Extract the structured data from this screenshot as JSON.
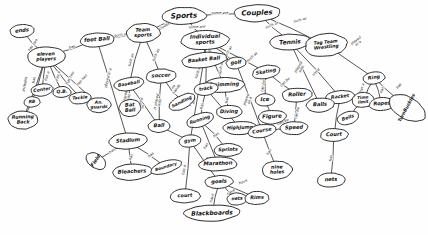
{
  "diagram": {
    "style": "hand-drawn ellipse concept map, black ink on white paper",
    "ink_color": "#1e1e1e",
    "paper_color": "#fefefe",
    "width": 428,
    "height": 235
  },
  "nodes": [
    {
      "id": "sports",
      "label": "Sports",
      "x": 184,
      "y": 16,
      "rx": 22,
      "ry": 8.5,
      "fs": 7.2,
      "rot": -2
    },
    {
      "id": "couples",
      "label": "Couples",
      "x": 257,
      "y": 13,
      "rx": 23,
      "ry": 8.5,
      "fs": 7.0,
      "rot": -2
    },
    {
      "id": "individual",
      "label": "Individual\nsports",
      "x": 205,
      "y": 40,
      "rx": 24,
      "ry": 9.5,
      "fs": 5.4,
      "rot": -2
    },
    {
      "id": "teamsports",
      "label": "Team\nsports",
      "x": 143,
      "y": 33,
      "rx": 17,
      "ry": 9.5,
      "fs": 5.0,
      "rot": -3
    },
    {
      "id": "football",
      "label": "foot Ball",
      "x": 97,
      "y": 40,
      "rx": 17,
      "ry": 7.0,
      "fs": 5.4,
      "rot": -4
    },
    {
      "id": "elevenplayers",
      "label": "eleven\nplayers",
      "x": 46,
      "y": 57,
      "rx": 19,
      "ry": 10.0,
      "fs": 4.8,
      "rot": -2
    },
    {
      "id": "ends",
      "label": "ends",
      "x": 22,
      "y": 31,
      "rx": 12,
      "ry": 6.5,
      "fs": 5.2,
      "rot": -6
    },
    {
      "id": "center",
      "label": "Center",
      "x": 42,
      "y": 90,
      "rx": 11,
      "ry": 6.0,
      "fs": 4.6,
      "rot": -8
    },
    {
      "id": "qb",
      "label": "Q.B.",
      "x": 62,
      "y": 92,
      "rx": 9,
      "ry": 5.5,
      "fs": 4.6,
      "rot": -3
    },
    {
      "id": "tackle",
      "label": "Tackle",
      "x": 80,
      "y": 98,
      "rx": 11,
      "ry": 5.8,
      "fs": 4.4,
      "rot": -5
    },
    {
      "id": "rb",
      "label": "RB",
      "x": 32,
      "y": 102,
      "rx": 8,
      "ry": 5.2,
      "fs": 4.4,
      "rot": -3
    },
    {
      "id": "anguards",
      "label": "An.\nguards",
      "x": 99,
      "y": 105,
      "rx": 12,
      "ry": 7.5,
      "fs": 4.4,
      "rot": -2
    },
    {
      "id": "runningback",
      "label": "Running\nBack",
      "x": 23,
      "y": 120,
      "rx": 15,
      "ry": 9.0,
      "fs": 4.8,
      "rot": -2
    },
    {
      "id": "baseball",
      "label": "Baseball",
      "x": 129,
      "y": 84,
      "rx": 15,
      "ry": 6.5,
      "fs": 4.6,
      "rot": -10
    },
    {
      "id": "soccer",
      "label": "soccer",
      "x": 161,
      "y": 76,
      "rx": 15,
      "ry": 7.0,
      "fs": 5.2,
      "rot": -3
    },
    {
      "id": "batball",
      "label": "Bat\nBall",
      "x": 130,
      "y": 108,
      "rx": 11,
      "ry": 8.5,
      "fs": 5.0,
      "rot": -3
    },
    {
      "id": "handling",
      "label": "handling",
      "x": 182,
      "y": 102,
      "rx": 14,
      "ry": 6.5,
      "fs": 4.4,
      "rot": -26
    },
    {
      "id": "ball",
      "label": "Ball",
      "x": 159,
      "y": 126,
      "rx": 11,
      "ry": 6.5,
      "fs": 5.2,
      "rot": -2
    },
    {
      "id": "basketball",
      "label": "Basket Ball",
      "x": 204,
      "y": 60,
      "rx": 23,
      "ry": 7.5,
      "fs": 5.2,
      "rot": -6
    },
    {
      "id": "golf",
      "label": "golf",
      "x": 236,
      "y": 63,
      "rx": 10,
      "ry": 5.8,
      "fs": 5.0,
      "rot": -6
    },
    {
      "id": "swimming",
      "label": "Swimming",
      "x": 224,
      "y": 85,
      "rx": 20,
      "ry": 7.5,
      "fs": 5.2,
      "rot": -2
    },
    {
      "id": "diving",
      "label": "Diving",
      "x": 229,
      "y": 112,
      "rx": 13,
      "ry": 6.5,
      "fs": 5.0,
      "rot": -2
    },
    {
      "id": "track",
      "label": "track",
      "x": 206,
      "y": 89,
      "rx": 12,
      "ry": 6.2,
      "fs": 4.8,
      "rot": -8
    },
    {
      "id": "highjump",
      "label": "HighJump",
      "x": 240,
      "y": 128,
      "rx": 17,
      "ry": 6.5,
      "fs": 4.8,
      "rot": -2
    },
    {
      "id": "running",
      "label": "Running",
      "x": 200,
      "y": 120,
      "rx": 14,
      "ry": 6.5,
      "fs": 4.6,
      "rot": -18
    },
    {
      "id": "sprints",
      "label": "Sprints",
      "x": 228,
      "y": 150,
      "rx": 14,
      "ry": 6.5,
      "fs": 4.8,
      "rot": -2
    },
    {
      "id": "marathon",
      "label": "Marathon",
      "x": 218,
      "y": 164,
      "rx": 19,
      "ry": 7.0,
      "fs": 5.4,
      "rot": -2
    },
    {
      "id": "tennis",
      "label": "Tennis",
      "x": 290,
      "y": 42,
      "rx": 20,
      "ry": 8.0,
      "fs": 6.0,
      "rot": -3
    },
    {
      "id": "tagteam",
      "label": "Tag Team\nWrestling",
      "x": 326,
      "y": 45,
      "rx": 21,
      "ry": 11.5,
      "fs": 4.6,
      "rot": -6
    },
    {
      "id": "skating",
      "label": "Skating",
      "x": 266,
      "y": 72,
      "rx": 14,
      "ry": 6.5,
      "fs": 4.8,
      "rot": -10
    },
    {
      "id": "ice",
      "label": "Ice",
      "x": 265,
      "y": 100,
      "rx": 10,
      "ry": 6.0,
      "fs": 5.4,
      "rot": -3
    },
    {
      "id": "figure",
      "label": "Figure",
      "x": 272,
      "y": 117,
      "rx": 14,
      "ry": 6.8,
      "fs": 5.4,
      "rot": -3
    },
    {
      "id": "roller",
      "label": "Roller",
      "x": 297,
      "y": 95,
      "rx": 15,
      "ry": 7.0,
      "fs": 5.4,
      "rot": -3
    },
    {
      "id": "speed",
      "label": "Speed",
      "x": 294,
      "y": 128,
      "rx": 14,
      "ry": 6.5,
      "fs": 5.2,
      "rot": -3
    },
    {
      "id": "racket",
      "label": "Racket",
      "x": 340,
      "y": 97,
      "rx": 14,
      "ry": 6.5,
      "fs": 4.8,
      "rot": -6
    },
    {
      "id": "balls",
      "label": "Balls",
      "x": 320,
      "y": 105,
      "rx": 14,
      "ry": 7.0,
      "fs": 5.2,
      "rot": -3
    },
    {
      "id": "ring",
      "label": "Ring",
      "x": 374,
      "y": 78,
      "rx": 11,
      "ry": 6.0,
      "fs": 4.8,
      "rot": -8
    },
    {
      "id": "timelimit",
      "label": "Time\nlimit",
      "x": 363,
      "y": 100,
      "rx": 11,
      "ry": 7.5,
      "fs": 4.2,
      "rot": -5
    },
    {
      "id": "ropes",
      "label": "Ropes",
      "x": 382,
      "y": 104,
      "rx": 13,
      "ry": 6.5,
      "fs": 5.0,
      "rot": -4
    },
    {
      "id": "turnbuckles",
      "label": "TurnBuckles",
      "x": 407,
      "y": 108,
      "rx": 11,
      "ry": 20.0,
      "fs": 4.6,
      "rot": -62
    },
    {
      "id": "bells",
      "label": "Bells",
      "x": 348,
      "y": 118,
      "rx": 11,
      "ry": 6.2,
      "fs": 4.6,
      "rot": -18
    },
    {
      "id": "court",
      "label": "Court",
      "x": 334,
      "y": 135,
      "rx": 14,
      "ry": 6.5,
      "fs": 5.2,
      "rot": -2
    },
    {
      "id": "nets",
      "label": "nets",
      "x": 331,
      "y": 180,
      "rx": 14,
      "ry": 7.0,
      "fs": 5.2,
      "rot": -2
    },
    {
      "id": "course",
      "label": "Course",
      "x": 262,
      "y": 131,
      "rx": 14,
      "ry": 6.5,
      "fs": 5.0,
      "rot": -10
    },
    {
      "id": "nineholes",
      "label": "nine\nholes",
      "x": 277,
      "y": 170,
      "rx": 15,
      "ry": 9.0,
      "fs": 4.8,
      "rot": -2
    },
    {
      "id": "stadium",
      "label": "Stadium",
      "x": 128,
      "y": 141,
      "rx": 19,
      "ry": 8.0,
      "fs": 5.2,
      "rot": -4
    },
    {
      "id": "field",
      "label": "Field",
      "x": 96,
      "y": 161,
      "rx": 7,
      "ry": 11.0,
      "fs": 4.8,
      "rot": -56
    },
    {
      "id": "bleachers",
      "label": "Bleachers",
      "x": 132,
      "y": 172,
      "rx": 20,
      "ry": 8.0,
      "fs": 5.2,
      "rot": -3
    },
    {
      "id": "boundary",
      "label": "Boundary",
      "x": 166,
      "y": 167,
      "rx": 16,
      "ry": 6.0,
      "fs": 4.2,
      "rot": -17
    },
    {
      "id": "gym",
      "label": "gym",
      "x": 190,
      "y": 141,
      "rx": 11,
      "ry": 6.0,
      "fs": 4.8,
      "rot": -6
    },
    {
      "id": "goals",
      "label": "goals",
      "x": 219,
      "y": 182,
      "rx": 14,
      "ry": 6.5,
      "fs": 5.2,
      "rot": -3
    },
    {
      "id": "courtb",
      "label": "court",
      "x": 185,
      "y": 196,
      "rx": 15,
      "ry": 7.0,
      "fs": 5.0,
      "rot": -2
    },
    {
      "id": "netsb",
      "label": "nets",
      "x": 237,
      "y": 199,
      "rx": 10,
      "ry": 6.0,
      "fs": 4.6,
      "rot": -3
    },
    {
      "id": "rims",
      "label": "Rims",
      "x": 257,
      "y": 198,
      "rx": 12,
      "ry": 6.5,
      "fs": 5.0,
      "rot": -2
    },
    {
      "id": "blackboards",
      "label": "Blackboards",
      "x": 212,
      "y": 213,
      "rx": 28,
      "ry": 8.0,
      "fs": 6.0,
      "rot": -2
    }
  ],
  "edges": [
    {
      "from": "sports",
      "to": "couples",
      "label": "some are",
      "lx": 220,
      "ly": 13,
      "rot": 0
    },
    {
      "from": "sports",
      "to": "individual",
      "label": "some are",
      "lx": 197,
      "ly": 27,
      "rot": -2
    },
    {
      "from": "sports",
      "to": "teamsports",
      "label": "includes",
      "lx": 163,
      "ly": 27,
      "rot": -30
    },
    {
      "from": "teamsports",
      "to": "football",
      "label": "such as",
      "lx": 121,
      "ly": 35,
      "rot": -8
    },
    {
      "from": "football",
      "to": "elevenplayers",
      "label": "has",
      "lx": 72,
      "ly": 47,
      "rot": -18
    },
    {
      "from": "elevenplayers",
      "to": "ends",
      "label": "has two",
      "lx": 33,
      "ly": 45,
      "rot": -55
    },
    {
      "from": "elevenplayers",
      "to": "center",
      "label": "has a",
      "lx": 47,
      "ly": 76,
      "rot": -72
    },
    {
      "from": "elevenplayers",
      "to": "qb",
      "label": "has a",
      "lx": 58,
      "ly": 76,
      "rot": -76
    },
    {
      "from": "elevenplayers",
      "to": "tackle",
      "label": "has two",
      "lx": 70,
      "ly": 78,
      "rot": -62
    },
    {
      "from": "elevenplayers",
      "to": "rb",
      "label": "has",
      "lx": 34,
      "ly": 80,
      "rot": -80
    },
    {
      "from": "elevenplayers",
      "to": "anguards",
      "label": "has two",
      "lx": 82,
      "ly": 80,
      "rot": -48
    },
    {
      "from": "rb",
      "to": "runningback",
      "label": "",
      "lx": 27,
      "ly": 111,
      "rot": 0
    },
    {
      "from": "elevenplayers",
      "to": "runningback",
      "label": "includes",
      "lx": 25,
      "ly": 84,
      "rot": -80
    },
    {
      "from": "teamsports",
      "to": "baseball",
      "label": "such as",
      "lx": 131,
      "ly": 60,
      "rot": -74
    },
    {
      "from": "teamsports",
      "to": "soccer",
      "label": "such as",
      "lx": 156,
      "ly": 55,
      "rot": -65
    },
    {
      "from": "football",
      "to": "stadium",
      "label": "played in a",
      "lx": 108,
      "ly": 78,
      "rot": -75
    },
    {
      "from": "baseball",
      "to": "batball",
      "label": "played\nwith",
      "lx": 127,
      "ly": 97,
      "rot": -78
    },
    {
      "from": "baseball",
      "to": "ball",
      "label": "is played\nin",
      "lx": 141,
      "ly": 106,
      "rot": -70
    },
    {
      "from": "soccer",
      "to": "ball",
      "label": "is played\nwith",
      "lx": 158,
      "ly": 102,
      "rot": -78
    },
    {
      "from": "soccer",
      "to": "handling",
      "label": "no\nhands",
      "lx": 175,
      "ly": 88,
      "rot": -55
    },
    {
      "from": "individual",
      "to": "basketball",
      "label": "such as",
      "lx": 210,
      "ly": 51,
      "rot": -72
    },
    {
      "from": "individual",
      "to": "golf",
      "label": "such as",
      "lx": 228,
      "ly": 52,
      "rot": -60
    },
    {
      "from": "individual",
      "to": "swimming",
      "label": "such as",
      "lx": 221,
      "ly": 68,
      "rot": -80
    },
    {
      "from": "swimming",
      "to": "diving",
      "label": "has",
      "lx": 227,
      "ly": 100,
      "rot": -80
    },
    {
      "from": "individual",
      "to": "track",
      "label": "such as",
      "lx": 198,
      "ly": 72,
      "rot": -70
    },
    {
      "from": "track",
      "to": "running",
      "label": "has",
      "lx": 202,
      "ly": 106,
      "rot": -75
    },
    {
      "from": "track",
      "to": "highjump",
      "label": "has",
      "lx": 226,
      "ly": 112,
      "rot": -45
    },
    {
      "from": "running",
      "to": "sprints",
      "label": "has",
      "lx": 216,
      "ly": 135,
      "rot": -40
    },
    {
      "from": "running",
      "to": "marathon",
      "label": "has",
      "lx": 206,
      "ly": 146,
      "rot": -60
    },
    {
      "from": "couples",
      "to": "tennis",
      "label": "such as",
      "lx": 272,
      "ly": 25,
      "rot": -22
    },
    {
      "from": "couples",
      "to": "tagteam",
      "label": "such as",
      "lx": 300,
      "ly": 20,
      "rot": -14
    },
    {
      "from": "individual",
      "to": "skating",
      "label": "such as",
      "lx": 252,
      "ly": 57,
      "rot": -42
    },
    {
      "from": "skating",
      "to": "ice",
      "label": "can be",
      "lx": 263,
      "ly": 86,
      "rot": -78
    },
    {
      "from": "ice",
      "to": "figure",
      "label": "",
      "lx": 268,
      "ly": 110,
      "rot": 0
    },
    {
      "from": "skating",
      "to": "roller",
      "label": "can be",
      "lx": 285,
      "ly": 82,
      "rot": -42
    },
    {
      "from": "figure",
      "to": "speed",
      "label": "can be",
      "lx": 283,
      "ly": 122,
      "rot": -22
    },
    {
      "from": "roller",
      "to": "speed",
      "label": "can be",
      "lx": 297,
      "ly": 113,
      "rot": -76
    },
    {
      "from": "tennis",
      "to": "racket",
      "label": "used",
      "lx": 316,
      "ly": 72,
      "rot": -44
    },
    {
      "from": "tennis",
      "to": "balls",
      "label": "played\nwith",
      "lx": 300,
      "ly": 68,
      "rot": -58
    },
    {
      "from": "tagteam",
      "to": "ring",
      "label": "played\nin a",
      "lx": 357,
      "ly": 42,
      "rot": -38
    },
    {
      "from": "ring",
      "to": "timelimit",
      "label": "has a",
      "lx": 362,
      "ly": 88,
      "rot": -72
    },
    {
      "from": "ring",
      "to": "ropes",
      "label": "has",
      "lx": 382,
      "ly": 90,
      "rot": -72
    },
    {
      "from": "ring",
      "to": "turnbuckles",
      "label": "has",
      "lx": 399,
      "ly": 86,
      "rot": -50
    },
    {
      "from": "timelimit",
      "to": "bells",
      "label": "",
      "lx": 355,
      "ly": 110,
      "rot": 0
    },
    {
      "from": "racket",
      "to": "court",
      "label": "",
      "lx": 338,
      "ly": 118,
      "rot": 0
    },
    {
      "from": "court",
      "to": "nets",
      "label": "has",
      "lx": 331,
      "ly": 158,
      "rot": -80
    },
    {
      "from": "golf",
      "to": "course",
      "label": "played\non a",
      "lx": 248,
      "ly": 100,
      "rot": -72
    },
    {
      "from": "speed",
      "to": "course",
      "label": "",
      "lx": 278,
      "ly": 130,
      "rot": 0
    },
    {
      "from": "course",
      "to": "nineholes",
      "label": "has",
      "lx": 269,
      "ly": 152,
      "rot": -60
    },
    {
      "from": "stadium",
      "to": "field",
      "label": "has",
      "lx": 112,
      "ly": 151,
      "rot": -38
    },
    {
      "from": "stadium",
      "to": "bleachers",
      "label": "has",
      "lx": 131,
      "ly": 157,
      "rot": -72
    },
    {
      "from": "stadium",
      "to": "boundary",
      "label": "has",
      "lx": 151,
      "ly": 155,
      "rot": -42
    },
    {
      "from": "basketball",
      "to": "gym",
      "label": "played\nin a",
      "lx": 192,
      "ly": 100,
      "rot": -80
    },
    {
      "from": "gym",
      "to": "goals",
      "label": "has a",
      "lx": 206,
      "ly": 162,
      "rot": -66
    },
    {
      "from": "gym",
      "to": "courtb",
      "label": "has a",
      "lx": 184,
      "ly": 170,
      "rot": -78
    },
    {
      "from": "goals",
      "to": "blackboards",
      "label": "have",
      "lx": 212,
      "ly": 198,
      "rot": -78
    },
    {
      "from": "goals",
      "to": "netsb",
      "label": "have",
      "lx": 231,
      "ly": 192,
      "rot": -32
    },
    {
      "from": "goals",
      "to": "rims",
      "label": "have",
      "lx": 243,
      "ly": 182,
      "rot": -22
    },
    {
      "from": "ball",
      "to": "gym",
      "label": "",
      "lx": 175,
      "ly": 133,
      "rot": 0
    }
  ]
}
